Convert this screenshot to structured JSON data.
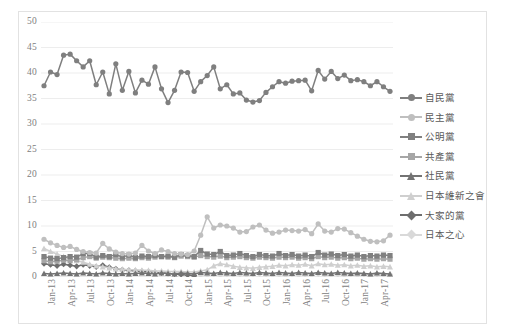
{
  "chart_data": {
    "type": "line",
    "title": "",
    "subtitle": "",
    "xlabel": "",
    "ylabel": "",
    "ylim": [
      0,
      50
    ],
    "ytick_step": 5,
    "yticks": [
      "0",
      "5",
      "10",
      "15",
      "20",
      "25",
      "30",
      "35",
      "40",
      "45",
      "50"
    ],
    "grid": "horizontal",
    "legend_position": "right",
    "x": [
      "Jan-13",
      "Feb-13",
      "Mar-13",
      "Apr-13",
      "May-13",
      "Jun-13",
      "Jul-13",
      "Aug-13",
      "Sep-13",
      "Oct-13",
      "Nov-13",
      "Dec-13",
      "Jan-14",
      "Feb-14",
      "Mar-14",
      "Apr-14",
      "May-14",
      "Jun-14",
      "Jul-14",
      "Aug-14",
      "Sep-14",
      "Oct-14",
      "Nov-14",
      "Dec-14",
      "Jan-15",
      "Feb-15",
      "Mar-15",
      "Apr-15",
      "May-15",
      "Jun-15",
      "Jul-15",
      "Aug-15",
      "Sep-15",
      "Oct-15",
      "Nov-15",
      "Dec-15",
      "Jan-16",
      "Feb-16",
      "Mar-16",
      "Apr-16",
      "May-16",
      "Jun-16",
      "Jul-16",
      "Aug-16",
      "Sep-16",
      "Oct-16",
      "Nov-16",
      "Dec-16",
      "Jan-17",
      "Feb-17",
      "Mar-17",
      "Apr-17",
      "May-17",
      "Jun-17"
    ],
    "xtick_labels": [
      "Jan-13",
      "Apr-13",
      "Jul-13",
      "Oct-13",
      "Jan-14",
      "Apr-14",
      "Jul-14",
      "Oct-14",
      "Jan-15",
      "Apr-15",
      "Jul-15",
      "Oct-15",
      "Jan-16",
      "Apr-16",
      "Jul-16",
      "Oct-16",
      "Jan-17",
      "Apr-17"
    ],
    "xtick_indices": [
      0,
      3,
      6,
      9,
      12,
      15,
      18,
      21,
      24,
      27,
      30,
      33,
      36,
      39,
      42,
      45,
      48,
      51
    ],
    "series": [
      {
        "name": "自民黨",
        "color": "#7f7f7f",
        "marker": "circle",
        "values": [
          37.5,
          40.2,
          39.7,
          43.5,
          43.7,
          42.4,
          41.2,
          42.4,
          37.7,
          40.2,
          35.9,
          41.8,
          36.6,
          40.3,
          36.1,
          38.6,
          37.8,
          41.2,
          36.9,
          34.2,
          36.6,
          40.2,
          40.1,
          36.4,
          38.3,
          39.5,
          41.2,
          36.9,
          37.7,
          35.9,
          36.1,
          34.7,
          34.3,
          34.6,
          36.2,
          37.3,
          38.3,
          38.0,
          38.4,
          38.5,
          38.6,
          36.5,
          40.5,
          38.8,
          40.3,
          38.9,
          39.6,
          38.5,
          38.7,
          38.3,
          37.5,
          38.3,
          37.3,
          36.4
        ]
      },
      {
        "name": "民主黨",
        "color": "#bfbfbf",
        "marker": "circle",
        "values": [
          7.4,
          6.7,
          6.2,
          5.8,
          6.0,
          5.4,
          5.0,
          4.8,
          4.7,
          6.6,
          5.5,
          4.9,
          4.6,
          4.5,
          4.7,
          6.2,
          5.1,
          4.6,
          5.3,
          5.0,
          4.6,
          4.5,
          4.4,
          5.1,
          8.2,
          11.8,
          9.6,
          10.2,
          10.0,
          9.6,
          8.8,
          8.9,
          9.8,
          10.2,
          9.2,
          8.6,
          8.8,
          9.2,
          9.1,
          9.0,
          9.3,
          8.5,
          10.4,
          9.0,
          8.8,
          9.5,
          9.4,
          8.7,
          8.0,
          7.4,
          7.0,
          6.9,
          7.1,
          8.2
        ]
      },
      {
        "name": "公明黨",
        "color": "#808080",
        "marker": "square",
        "values": [
          4.0,
          3.7,
          3.6,
          3.8,
          4.0,
          3.9,
          4.6,
          4.6,
          3.9,
          4.2,
          4.0,
          4.4,
          3.9,
          4.3,
          3.8,
          4.1,
          4.0,
          4.2,
          4.0,
          4.1,
          3.9,
          4.4,
          4.2,
          4.0,
          5.2,
          4.5,
          4.4,
          5.0,
          4.2,
          4.3,
          4.6,
          4.2,
          4.0,
          4.4,
          4.2,
          4.1,
          4.6,
          4.2,
          4.4,
          4.1,
          4.3,
          4.0,
          4.8,
          4.3,
          4.5,
          4.2,
          4.4,
          4.1,
          4.3,
          4.0,
          4.2,
          4.1,
          4.3,
          4.2
        ]
      },
      {
        "name": "共產黨",
        "color": "#a6a6a6",
        "marker": "square",
        "values": [
          3.2,
          3.0,
          3.1,
          3.3,
          3.2,
          3.4,
          3.8,
          4.0,
          3.7,
          3.9,
          3.8,
          3.7,
          3.6,
          3.7,
          3.6,
          3.8,
          3.7,
          3.9,
          4.0,
          3.9,
          3.8,
          4.1,
          4.0,
          3.9,
          4.2,
          4.0,
          3.9,
          4.1,
          3.8,
          3.9,
          4.0,
          3.8,
          3.7,
          3.9,
          3.8,
          3.7,
          3.9,
          3.8,
          3.9,
          3.7,
          3.8,
          3.6,
          4.0,
          3.8,
          3.9,
          3.7,
          3.8,
          3.6,
          3.7,
          3.5,
          3.6,
          3.5,
          3.6,
          3.5
        ]
      },
      {
        "name": "社民黨",
        "color": "#737373",
        "marker": "triangle",
        "values": [
          0.7,
          0.6,
          0.7,
          0.8,
          0.7,
          0.6,
          0.8,
          0.7,
          0.6,
          0.8,
          0.7,
          0.6,
          0.7,
          0.6,
          0.7,
          0.8,
          0.7,
          0.6,
          0.8,
          0.7,
          0.6,
          0.8,
          0.7,
          0.6,
          0.9,
          0.8,
          0.7,
          0.9,
          0.8,
          0.7,
          0.9,
          0.8,
          0.7,
          0.9,
          0.8,
          0.7,
          0.9,
          0.8,
          0.7,
          0.9,
          0.8,
          0.7,
          0.9,
          0.8,
          0.7,
          0.9,
          0.8,
          0.7,
          0.8,
          0.7,
          0.6,
          0.8,
          0.7,
          0.6
        ]
      },
      {
        "name": "日本維新之會",
        "color": "#cfcfcf",
        "marker": "triangle",
        "values": [
          5.6,
          5.0,
          4.5,
          4.0,
          3.6,
          3.2,
          2.9,
          2.5,
          2.2,
          2.0,
          1.8,
          1.6,
          1.5,
          1.4,
          1.4,
          1.3,
          1.3,
          1.2,
          1.2,
          1.1,
          1.1,
          1.1,
          1.0,
          1.0,
          1.2,
          1.4,
          2.2,
          2.6,
          2.4,
          2.1,
          1.9,
          1.8,
          1.7,
          1.9,
          2.0,
          2.1,
          2.3,
          2.2,
          2.4,
          2.3,
          2.5,
          2.2,
          2.6,
          2.4,
          2.5,
          2.3,
          2.4,
          2.2,
          2.3,
          2.1,
          2.2,
          2.0,
          2.1,
          2.0
        ]
      },
      {
        "name": "大家的黨",
        "color": "#6e6e6e",
        "marker": "diamond",
        "values": [
          2.6,
          2.4,
          2.2,
          2.5,
          2.3,
          2.1,
          2.4,
          2.2,
          2.0,
          2.3,
          1.9,
          1.6,
          1.4,
          1.3,
          1.2,
          1.1,
          1.0,
          0.9,
          0.8,
          0.7,
          0.6,
          0.5,
          0.4,
          0.3,
          null,
          null,
          null,
          null,
          null,
          null,
          null,
          null,
          null,
          null,
          null,
          null,
          null,
          null,
          null,
          null,
          null,
          null,
          null,
          null,
          null,
          null,
          null,
          null,
          null,
          null,
          null,
          null,
          null,
          null
        ]
      },
      {
        "name": "日本之心",
        "color": "#d9d9d9",
        "marker": "diamond",
        "values": [
          null,
          null,
          null,
          null,
          null,
          null,
          null,
          null,
          null,
          null,
          null,
          null,
          null,
          null,
          null,
          null,
          null,
          null,
          null,
          null,
          null,
          null,
          null,
          null,
          0.4,
          0.4,
          0.5,
          0.4,
          0.5,
          0.4,
          0.5,
          0.4,
          0.5,
          0.6,
          0.5,
          0.4,
          0.5,
          0.4,
          0.5,
          0.4,
          0.5,
          0.4,
          0.6,
          0.5,
          0.4,
          0.5,
          0.4,
          0.5,
          0.4,
          0.5,
          0.4,
          0.5,
          0.4,
          0.5
        ]
      }
    ]
  },
  "style": {
    "grid_color": "#ededed",
    "frame_color": "#e2e2e2",
    "axis_text_color": "#808080",
    "legend_text_color": "#595959",
    "background": "#ffffff"
  }
}
